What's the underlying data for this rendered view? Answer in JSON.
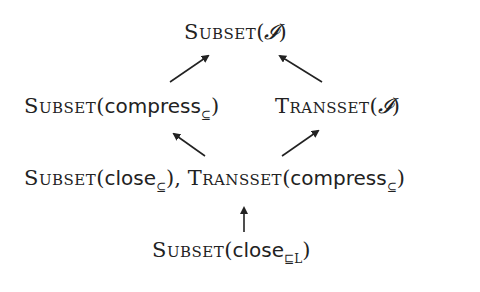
{
  "nodes": {
    "top": {
      "op": "Subset",
      "paren_open": "(",
      "arg": "𝓘",
      "sub": "",
      "paren_close": ")"
    },
    "mid_left": {
      "op": "Subset",
      "paren_open": "(",
      "arg": "compress",
      "sub": "⊆",
      "paren_close": ")"
    },
    "mid_right": {
      "op": "Transset",
      "paren_open": "(",
      "arg": "𝓘",
      "sub": "",
      "paren_close": ")"
    },
    "lower_a": {
      "op": "Subset",
      "paren_open": "(",
      "arg": "close",
      "sub": "⊆",
      "paren_close": ")",
      "sep": ", "
    },
    "lower_b": {
      "op": "Transset",
      "paren_open": "(",
      "arg": "compress",
      "sub": "⊆",
      "paren_close": ")"
    },
    "bottom": {
      "op": "Subset",
      "paren_open": "(",
      "arg": "close",
      "sub": "⊑L",
      "paren_close": ")"
    }
  },
  "edges": [
    {
      "from": "mid_left",
      "to": "top"
    },
    {
      "from": "mid_right",
      "to": "top"
    },
    {
      "from": "lower",
      "to": "mid_left"
    },
    {
      "from": "lower",
      "to": "mid_right"
    },
    {
      "from": "bottom",
      "to": "lower"
    }
  ],
  "colors": {
    "ink": "#222222",
    "background": "#ffffff"
  }
}
